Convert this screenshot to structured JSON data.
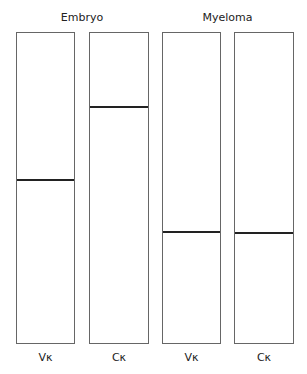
{
  "groups": [
    {
      "label": "Embryo"
    },
    {
      "label": "Myeloma"
    }
  ],
  "lanes": [
    {
      "label": "Vκ",
      "group": "Embryo",
      "band_y": 179
    },
    {
      "label": "Cκ",
      "group": "Embryo",
      "band_y": 106
    },
    {
      "label": "Vκ",
      "group": "Myeloma",
      "band_y": 231
    },
    {
      "label": "Cκ",
      "group": "Myeloma",
      "band_y": 232
    }
  ]
}
